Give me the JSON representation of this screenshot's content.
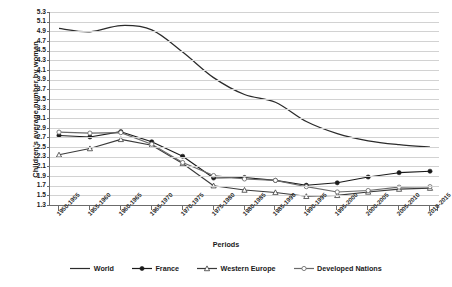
{
  "chart_data": {
    "type": "line",
    "title": "",
    "xlabel": "Periods",
    "ylabel": "Children's average number by woman",
    "ylim": [
      1.3,
      5.3
    ],
    "ytick_step": 0.2,
    "grid": true,
    "legend_position": "bottom",
    "categories": [
      "1950-1955",
      "1955-1960",
      "1960-1965",
      "1965-1970",
      "1970-1975",
      "1975-1980",
      "1980-1985",
      "1985-1990",
      "1990-1995",
      "1995-2000",
      "2000-2005",
      "2005-2010",
      "2010-2015"
    ],
    "yticks": [
      "1.3",
      "1.5",
      "1.7",
      "1.9",
      "2.1",
      "2.3",
      "2.5",
      "2.7",
      "2.9",
      "3.1",
      "3.3",
      "3.5",
      "3.7",
      "3.9",
      "4.1",
      "4.3",
      "4.5",
      "4.7",
      "4.9",
      "5.1",
      "5.3"
    ],
    "series": [
      {
        "name": "World",
        "marker": "none",
        "color": "#2b2b2b",
        "values": [
          4.96,
          4.89,
          5.02,
          4.93,
          4.47,
          3.94,
          3.59,
          3.43,
          3.03,
          2.78,
          2.63,
          2.55,
          2.5
        ]
      },
      {
        "name": "France",
        "marker": "filled-diamond",
        "color": "#1a1a1a",
        "values": [
          2.74,
          2.71,
          2.82,
          2.61,
          2.31,
          1.86,
          1.87,
          1.81,
          1.71,
          1.76,
          1.88,
          1.97,
          2.0
        ]
      },
      {
        "name": "Western Europe",
        "marker": "open-triangle",
        "color": "#3a3a3a",
        "values": [
          2.34,
          2.47,
          2.66,
          2.54,
          2.16,
          1.7,
          1.61,
          1.56,
          1.48,
          1.5,
          1.57,
          1.63,
          1.65
        ]
      },
      {
        "name": "Developed Nations",
        "marker": "open-circle",
        "color": "#6a6a6a",
        "values": [
          2.81,
          2.79,
          2.8,
          2.56,
          2.18,
          1.91,
          1.84,
          1.81,
          1.68,
          1.57,
          1.6,
          1.67,
          1.68
        ]
      }
    ]
  },
  "legend": [
    {
      "label": "World",
      "marker": "none"
    },
    {
      "label": "France",
      "marker": "filled-diamond"
    },
    {
      "label": "Western Europe",
      "marker": "open-triangle"
    },
    {
      "label": "Developed Nations",
      "marker": "open-circle"
    }
  ]
}
